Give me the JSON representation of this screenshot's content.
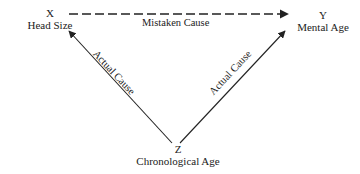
{
  "diagram": {
    "nodes": [
      {
        "id": "x",
        "letter": "X",
        "label": "Head Size"
      },
      {
        "id": "y",
        "letter": "Y",
        "label": "Mental Age"
      },
      {
        "id": "z",
        "letter": "Z",
        "label": "Chronological Age"
      }
    ],
    "edges": [
      {
        "from": "x",
        "to": "y",
        "label": "Mistaken Cause",
        "style": "dashed"
      },
      {
        "from": "z",
        "to": "x",
        "label": "Actual Cause",
        "style": "solid"
      },
      {
        "from": "z",
        "to": "y",
        "label": "Actual Cause",
        "style": "solid"
      }
    ],
    "colors": {
      "stroke": "#222222",
      "text": "#222222",
      "background": "#ffffff"
    }
  }
}
